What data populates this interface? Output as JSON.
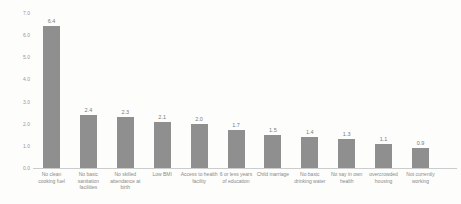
{
  "chart_data": {
    "type": "bar",
    "title": "",
    "xlabel": "",
    "ylabel": "",
    "categories": [
      "No clean cooking fuel",
      "No basic sanitation facilities",
      "No skilled attendance at birth",
      "Low BMI",
      "Access to health facility",
      "6 or less years of education",
      "Child marriage",
      "No basic drinking water",
      "No say in own health",
      "overcrowded housing",
      "Not currently working"
    ],
    "values": [
      6.4,
      2.4,
      2.3,
      2.1,
      2.0,
      1.7,
      1.5,
      1.4,
      1.3,
      1.1,
      0.9
    ],
    "data_labels": [
      "6.4",
      "2.4",
      "2.3",
      "2.1",
      "2.0",
      "1.7",
      "1.5",
      "1.4",
      "1.3",
      "1.1",
      "0.9"
    ],
    "yticks": [
      "0.0",
      "1.0",
      "2.0",
      "3.0",
      "4.0",
      "5.0",
      "6.0",
      "7.0"
    ],
    "ylim": [
      0,
      7
    ],
    "grid": false,
    "legend": false,
    "data_labels_shown": true,
    "bar_color": "#8f8f8f",
    "axis_color": "#cccccc",
    "tick_label_color": "#979797",
    "category_label_color": "#8a8a8a",
    "value_label_color": "#7b7b7b",
    "background_color": "#fdfdfc"
  }
}
